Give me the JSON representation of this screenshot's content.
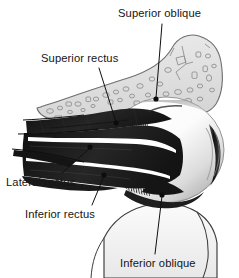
{
  "figure": {
    "background_color": "#ffffff",
    "width": 239,
    "height": 278
  },
  "palette": {
    "background": "#ffffff",
    "label_text": "#151515",
    "leader_line": "#101010",
    "muscle_dark": "#1b1b1b",
    "muscle_mid": "#2e2e2e",
    "muscle_shadow": "#0b0b0b",
    "sclera_light": "#fdfdfd",
    "sclera_shade": "#c9c9c9",
    "cornea_dark": "#1a1a1a",
    "bone_fill": "#e4e4e4",
    "bone_outline": "#6f6f6f",
    "bone_cell": "#8d8d8d",
    "cheek_fill": "#f4f4f4",
    "cheek_outline": "#3a3a3a",
    "orbit_rim": "#4a4a4a"
  },
  "labels": [
    {
      "id": "superior-oblique",
      "text": "Superior oblique",
      "position": "top-right",
      "leader": "descends to the trochlea / superior oblique tendon above the globe"
    },
    {
      "id": "superior-rectus",
      "text": "Superior rectus",
      "position": "upper-left",
      "leader": "descends to the superior rectus muscle belly"
    },
    {
      "id": "lateral-rectus",
      "text": "Lateral rectus",
      "position": "left",
      "leader": "rises to the lateral rectus muscle belly"
    },
    {
      "id": "inferior-rectus",
      "text": "Inferior rectus",
      "position": "lower-left",
      "leader": "rises to the inferior rectus muscle"
    },
    {
      "id": "inferior-oblique",
      "text": "Inferior oblique",
      "position": "bottom",
      "leader": "rises to the inferior oblique muscle at the lower globe"
    }
  ],
  "structures": [
    {
      "id": "frontal-bone",
      "name": "Frontal bone with cancellous texture",
      "tone": "light gray, outlined trabecular cells"
    },
    {
      "id": "eyeball",
      "name": "Eyeball / sclera",
      "tone": "white with gray shading"
    },
    {
      "id": "cornea-iris",
      "name": "Cornea and iris",
      "tone": "dark crescent at right edge"
    },
    {
      "id": "muscle-cone",
      "name": "Extraocular muscle cone",
      "tone": "near-black converging bellies"
    },
    {
      "id": "muscle-insertion",
      "name": "Striated muscle insertions on sclera",
      "tone": "fine fanning striations"
    },
    {
      "id": "maxilla-cheek",
      "name": "Maxilla / cheek contour",
      "tone": "pale outline below the globe"
    }
  ]
}
